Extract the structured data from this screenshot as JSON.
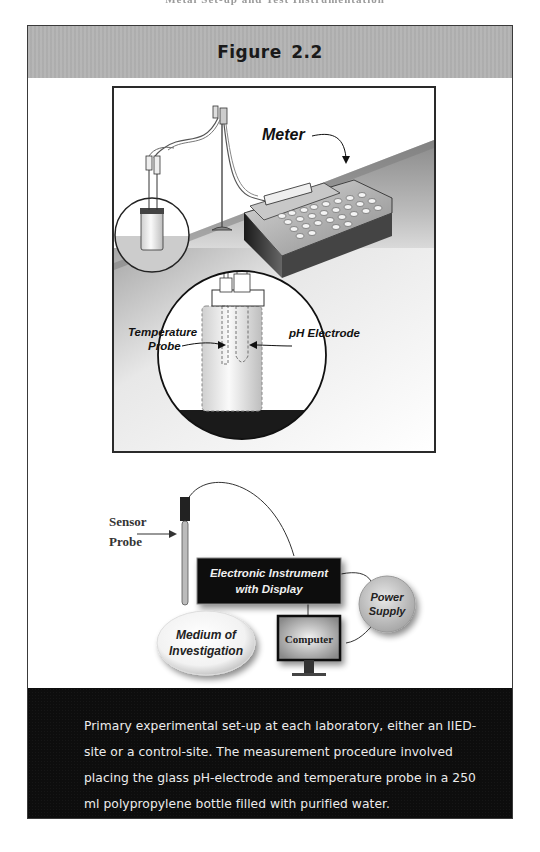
{
  "page": {
    "running_header": "Metal Set-up and Test Instrumentation"
  },
  "figure": {
    "title": "Figure 2.2",
    "top_panel": {
      "labels": {
        "meter": "Meter",
        "temperature_probe_line1": "Temperature",
        "temperature_probe_line2": "Probe",
        "ph_electrode": "pH Electrode"
      }
    },
    "schematic": {
      "labels": {
        "sensor_probe_line1": "Sensor",
        "sensor_probe_line2": "Probe",
        "instrument_line1": "Electronic Instrument",
        "instrument_line2": "with Display",
        "power_supply_line1": "Power",
        "power_supply_line2": "Supply",
        "computer": "Computer",
        "medium_line1": "Medium of",
        "medium_line2": "Investigation"
      }
    },
    "caption": "Primary experimental set-up at each laboratory, either an IIED-site or a control-site. The measurement procedure involved placing the glass pH-electrode and temperature probe in a 250 ml polypropylene bottle filled with purified water."
  },
  "colors": {
    "header_bg": "#b3b3b3",
    "caption_bg": "#0d0d0d",
    "caption_text": "#ececec",
    "frame_border": "#2a2a2a"
  }
}
